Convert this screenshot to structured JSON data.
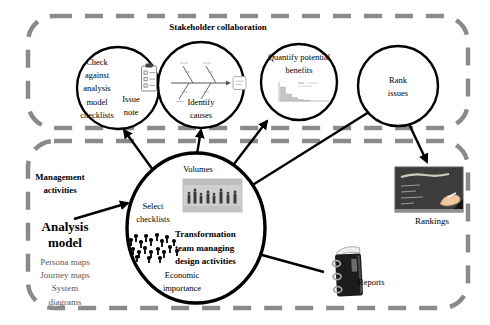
{
  "stakeholder_panel": {
    "title": "Stakeholder collaboration"
  },
  "management_panel": {
    "title": "Management activities"
  },
  "circles": {
    "check": {
      "label": "Check against analysis model checklists",
      "note": "Issue note",
      "icon": "checklist-clipboard-icon"
    },
    "identify": {
      "label": "Identify causes",
      "icon": "fishbone-diagram-icon"
    },
    "quantify": {
      "label": "Quantify potential benefits",
      "icon": "pareto-chart-icon"
    },
    "rank": {
      "label": "Rank issues"
    }
  },
  "central_circle": {
    "volumes_label": "Volumes",
    "select_label": "Select checklists",
    "team_label": "Transformation team managing design activities",
    "economic_label": "Economic importance",
    "icons": [
      "meeting-photo",
      "crowd-icon"
    ]
  },
  "analysis_model": {
    "title": "Analysis model",
    "items": [
      "Persona maps",
      "Journey maps",
      "System diagrams"
    ]
  },
  "outputs": {
    "reports_label": "Reports",
    "rankings_label": "Rankings"
  },
  "colors": {
    "dashed_border": "#8a8a8a",
    "connector_line": "#000000",
    "blackboard": "#3c3c3c",
    "chalk": "#cfcabc",
    "hand": "#edc9a0",
    "photo_gray": "#cfcfcf"
  }
}
